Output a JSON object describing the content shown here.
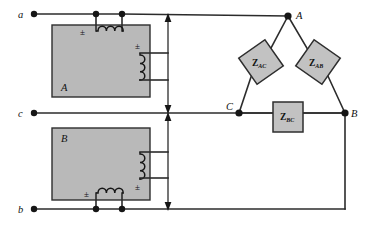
{
  "figure": {
    "type": "electrical-circuit-schematic",
    "background_color": "#ffffff",
    "wire_color": "#2b2b2b",
    "block_fill": "#b9b9b9",
    "impedance_fill": "#c2c2c2"
  },
  "terminals": [
    {
      "id": "a",
      "label": "a",
      "x": 30,
      "y": 14
    },
    {
      "id": "c",
      "label": "c",
      "x": 30,
      "y": 113
    },
    {
      "id": "b",
      "label": "b",
      "x": 30,
      "y": 209
    }
  ],
  "source_blocks": [
    {
      "id": "A",
      "label": "A",
      "label_x": 87,
      "label_y": 88,
      "x": 52,
      "y": 25,
      "width": 98,
      "height": 72,
      "primary_coil": {
        "orientation": "horizontal",
        "turns": 3,
        "polarity_mark": "±",
        "polarity_side": "left"
      },
      "secondary_coil": {
        "orientation": "vertical",
        "turns": 3,
        "polarity_mark": "±",
        "polarity_side": "top"
      }
    },
    {
      "id": "B",
      "label": "B",
      "label_x": 68,
      "label_y": 138,
      "x": 52,
      "y": 128,
      "width": 98,
      "height": 72,
      "primary_coil": {
        "orientation": "horizontal",
        "turns": 3,
        "polarity_mark": "±",
        "polarity_side": "left"
      },
      "secondary_coil": {
        "orientation": "vertical",
        "turns": 3,
        "polarity_mark": "±",
        "polarity_side": "bottom"
      }
    }
  ],
  "load_nodes": [
    {
      "id": "A",
      "label": "A",
      "x": 288,
      "y": 16
    },
    {
      "id": "C",
      "label": "C",
      "x": 239,
      "y": 113
    },
    {
      "id": "B",
      "label": "B",
      "x": 345,
      "y": 113
    }
  ],
  "impedances": [
    {
      "id": "Z_AC",
      "symbol": "Z",
      "subscript": "AC",
      "shape": "rotated-square",
      "rotation_deg": -35,
      "cx": 261,
      "cy": 62,
      "size": 32,
      "between": [
        "A",
        "C"
      ]
    },
    {
      "id": "Z_AB",
      "symbol": "Z",
      "subscript": "AB",
      "shape": "rotated-square",
      "rotation_deg": 35,
      "cx": 318,
      "cy": 62,
      "size": 32,
      "between": [
        "A",
        "B"
      ]
    },
    {
      "id": "Z_BC",
      "symbol": "Z",
      "subscript": "BC",
      "shape": "square",
      "cx": 288,
      "cy": 117,
      "size": 30,
      "between": [
        "B",
        "C"
      ]
    }
  ],
  "voltage_arrows": [
    {
      "id": "arrow-upper",
      "direction": "double",
      "x": 168,
      "y_top": 16,
      "y_bottom": 110
    },
    {
      "id": "arrow-lower",
      "direction": "double",
      "x": 168,
      "y_top": 117,
      "y_bottom": 209
    }
  ],
  "polarity_marks": [
    {
      "id": "pm-A-primary",
      "text": "±",
      "x": 86,
      "y": 37
    },
    {
      "id": "pm-A-secondary",
      "text": "±",
      "x": 140,
      "y": 45
    },
    {
      "id": "pm-B-secondary",
      "text": "±",
      "x": 140,
      "y": 186
    },
    {
      "id": "pm-B-primary",
      "text": "±",
      "x": 90,
      "y": 196
    }
  ]
}
